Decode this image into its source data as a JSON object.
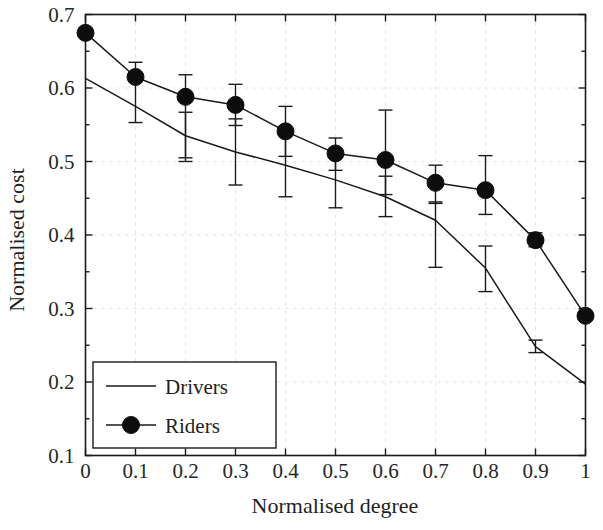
{
  "chart_data": {
    "type": "line",
    "title": "",
    "xlabel": "Normalised degree",
    "ylabel": "Normalised cost",
    "xlim": [
      0,
      1
    ],
    "ylim": [
      0.1,
      0.7
    ],
    "grid": true,
    "legend_position": "lower-left",
    "x": [
      0,
      0.1,
      0.2,
      0.3,
      0.4,
      0.5,
      0.6,
      0.7,
      0.8,
      0.9,
      1
    ],
    "xticklabels": [
      "0",
      "0.1",
      "0.2",
      "0.3",
      "0.4",
      "0.5",
      "0.6",
      "0.7",
      "0.8",
      "0.9",
      "1"
    ],
    "yticklabels": [
      "0.1",
      "0.2",
      "0.3",
      "0.4",
      "0.5",
      "0.6",
      "0.7"
    ],
    "yticks": [
      0.1,
      0.2,
      0.3,
      0.4,
      0.5,
      0.6,
      0.7
    ],
    "series": [
      {
        "name": "Drivers",
        "marker": "none",
        "values": [
          0.613,
          0.575,
          0.535,
          0.513,
          0.495,
          0.475,
          0.452,
          0.42,
          0.355,
          0.248,
          0.197
        ],
        "err_low": [
          0.613,
          0.575,
          0.5,
          0.468,
          0.452,
          0.437,
          0.425,
          0.356,
          0.323,
          0.24,
          0.197
        ],
        "err_high": [
          0.613,
          0.575,
          0.567,
          0.558,
          0.537,
          0.513,
          0.48,
          0.445,
          0.385,
          0.257,
          0.197
        ]
      },
      {
        "name": "Riders",
        "marker": "circle",
        "values": [
          0.675,
          0.615,
          0.588,
          0.577,
          0.541,
          0.511,
          0.502,
          0.471,
          0.461,
          0.393,
          0.29
        ],
        "err_low": [
          0.675,
          0.553,
          0.505,
          0.549,
          0.507,
          0.488,
          0.455,
          0.443,
          0.428,
          0.384,
          0.29
        ],
        "err_high": [
          0.675,
          0.635,
          0.618,
          0.605,
          0.575,
          0.532,
          0.57,
          0.495,
          0.508,
          0.403,
          0.29
        ]
      }
    ]
  },
  "legend": {
    "entries": [
      {
        "label": "Drivers",
        "marker": "none"
      },
      {
        "label": "Riders",
        "marker": "circle"
      }
    ]
  },
  "colors": {
    "line": "#1a1a1a",
    "marker": "#0d0d0d",
    "grid": "#e2e2e2",
    "background": "#ffffff"
  }
}
